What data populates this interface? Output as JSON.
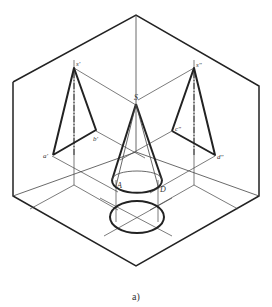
{
  "figure": {
    "caption": "a)",
    "colors": {
      "line": "#222222",
      "thin": "#444444",
      "background": "#ffffff"
    }
  },
  "labels": {
    "s_front": "s'",
    "a_front": "a'",
    "b_front": "b'",
    "s_side": "s\"",
    "c_side": "c\"",
    "d_side": "d\"",
    "S": "S",
    "A": "A",
    "D": "D"
  }
}
